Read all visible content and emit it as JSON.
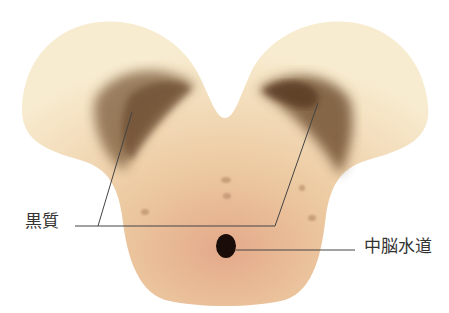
{
  "diagram": {
    "labels": {
      "substantia_nigra": "黒質",
      "cerebral_aqueduct": "中脳水道"
    },
    "colors": {
      "tissue_light": "#f6e6c6",
      "tissue_mid": "#ecc9a0",
      "tissue_lower": "#e4a98a",
      "nigra": "#6b4a2e",
      "aqueduct": "#1a0c08",
      "leader_line": "#444444"
    }
  }
}
